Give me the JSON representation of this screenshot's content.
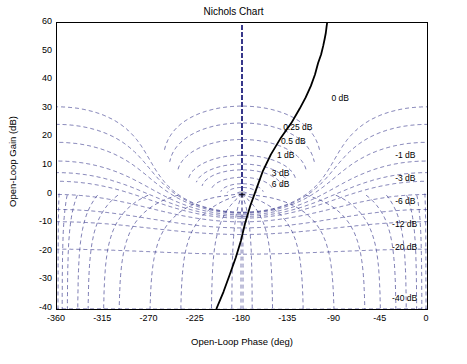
{
  "chart_data": {
    "type": "line",
    "title": "Nichols Chart",
    "xlabel": "Open-Loop Phase (deg)",
    "ylabel": "Open-Loop Gain (dB)",
    "xlim": [
      -360,
      0
    ],
    "ylim": [
      -40,
      60
    ],
    "xticks": [
      -360,
      -315,
      -270,
      -225,
      -180,
      -135,
      -90,
      -45,
      0
    ],
    "yticks": [
      -40,
      -30,
      -20,
      -10,
      0,
      10,
      20,
      30,
      40,
      50,
      60
    ],
    "grid": "dashed-nichols-grid",
    "legend": "none",
    "series": [
      {
        "name": "open-loop response",
        "style": "solid-black",
        "x": [
          -205,
          -198,
          -192,
          -186,
          -181,
          -177,
          -172,
          -166,
          -160,
          -152,
          -142,
          -132,
          -124,
          -118,
          -113,
          -109,
          -106,
          -103,
          -101,
          -99.5,
          -98.5,
          -97.8,
          -97.2
        ],
        "y": [
          -40,
          -34,
          -28,
          -22,
          -16,
          -10,
          -4,
          2,
          8,
          14,
          20,
          25,
          30,
          34,
          38,
          42,
          46,
          49,
          52,
          54.5,
          56.5,
          58.5,
          60
        ]
      }
    ],
    "annotations": [
      {
        "label": "0 dB",
        "x": -92,
        "y": 33
      },
      {
        "label": "0.25 dB",
        "x": -139,
        "y": 23
      },
      {
        "label": "0.5 dB",
        "x": -141,
        "y": 18
      },
      {
        "label": "1 dB",
        "x": -145,
        "y": 13
      },
      {
        "label": "3 dB",
        "x": -150,
        "y": 7
      },
      {
        "label": "6 dB",
        "x": -150,
        "y": 3
      },
      {
        "label": "-1 dB",
        "x": -30,
        "y": 13
      },
      {
        "label": "-3 dB",
        "x": -30,
        "y": 5
      },
      {
        "label": "-6 dB",
        "x": -30,
        "y": -3
      },
      {
        "label": "-12 dB",
        "x": -33,
        "y": -11
      },
      {
        "label": "-20 dB",
        "x": -33,
        "y": -19
      },
      {
        "label": "-40 dB",
        "x": -33,
        "y": -37
      }
    ]
  }
}
